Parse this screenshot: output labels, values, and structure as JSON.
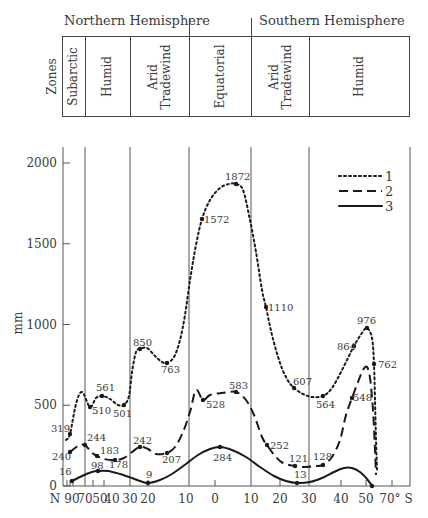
{
  "header": {
    "northern_label": "Northern Hemisphere",
    "southern_label": "Southern Hemisphere",
    "zones_label": "Zones",
    "zones": [
      {
        "name": "Subarctic",
        "lines": [
          "Subarctic"
        ],
        "x0": 62,
        "x1": 85
      },
      {
        "name": "Humid",
        "lines": [
          "Humid"
        ],
        "x0": 85,
        "x1": 130
      },
      {
        "name": "Arid Tradewind",
        "lines": [
          "Arid",
          "Tradewind"
        ],
        "x0": 130,
        "x1": 189
      },
      {
        "name": "Equatorial",
        "lines": [
          "Equatorial"
        ],
        "x0": 189,
        "x1": 251
      },
      {
        "name": "Arid Tradewind",
        "lines": [
          "Arid",
          "Tradewind"
        ],
        "x0": 251,
        "x1": 309
      },
      {
        "name": "Humid",
        "lines": [
          "Humid"
        ],
        "x0": 309,
        "x1": 410
      }
    ]
  },
  "chart_data": {
    "type": "line",
    "title": "",
    "xlabel": "Latitude (N 90° … 70° S)",
    "ylabel": "mm",
    "ylim": [
      0,
      2000
    ],
    "yticks": [
      0,
      500,
      1000,
      1500,
      2000
    ],
    "x_tick_labels": [
      {
        "label": "N 90",
        "px": 67
      },
      {
        "label": "70",
        "px": 75
      },
      {
        "label": "50",
        "px": 93
      },
      {
        "label": "40",
        "px": 104
      },
      {
        "label": "30",
        "px": 130
      },
      {
        "label": "20",
        "px": 148
      },
      {
        "label": "10",
        "px": 186
      },
      {
        "label": "0",
        "px": 215
      },
      {
        "label": "10",
        "px": 251
      },
      {
        "label": "20",
        "px": 280
      },
      {
        "label": "30",
        "px": 309
      },
      {
        "label": "40",
        "px": 341
      },
      {
        "label": "50",
        "px": 366
      },
      {
        "label": "70° S",
        "px": 392
      }
    ],
    "grid": false,
    "zone_boundaries_px": [
      85,
      130,
      189,
      251,
      309,
      410
    ],
    "legend": {
      "position": "upper right",
      "entries": [
        "1",
        "2",
        "3"
      ]
    },
    "series": [
      {
        "name": "1",
        "style": "dotted",
        "labeled_points": [
          {
            "lat": "67N",
            "value": 319,
            "px": 70
          },
          {
            "lat": "55N",
            "value": 510,
            "px": 90
          },
          {
            "lat": "45N",
            "value": 561,
            "px": 102
          },
          {
            "lat": "35N",
            "value": 501,
            "px": 124
          },
          {
            "lat": "25N",
            "value": 850,
            "px": 140
          },
          {
            "lat": "15N",
            "value": 763,
            "px": 167
          },
          {
            "lat": "3N",
            "value": 1572,
            "px": 202
          },
          {
            "lat": "5S",
            "value": 1872,
            "px": 234
          },
          {
            "lat": "15S",
            "value": 1110,
            "px": 265
          },
          {
            "lat": "25S",
            "value": 607,
            "px": 294
          },
          {
            "lat": "35S",
            "value": 564,
            "px": 323
          },
          {
            "lat": "45S",
            "value": 864,
            "px": 354
          },
          {
            "lat": "50S",
            "value": 976,
            "px": 367
          },
          {
            "lat": "55S",
            "value": 762,
            "px": 374
          }
        ],
        "path": [
          [
            66,
            440
          ],
          [
            70,
            434
          ],
          [
            76,
            404
          ],
          [
            82,
            392
          ],
          [
            90,
            407
          ],
          [
            96,
            398
          ],
          [
            102,
            396
          ],
          [
            110,
            399
          ],
          [
            118,
            405
          ],
          [
            124,
            405
          ],
          [
            129,
            396
          ],
          [
            132,
            372
          ],
          [
            136,
            352
          ],
          [
            140,
            349
          ],
          [
            147,
            348
          ],
          [
            155,
            356
          ],
          [
            162,
            362
          ],
          [
            167,
            363
          ],
          [
            174,
            357
          ],
          [
            180,
            340
          ],
          [
            185,
            315
          ],
          [
            190,
            280
          ],
          [
            196,
            245
          ],
          [
            202,
            219
          ],
          [
            210,
            200
          ],
          [
            220,
            188
          ],
          [
            229,
            184
          ],
          [
            236,
            184
          ],
          [
            243,
            190
          ],
          [
            250,
            220
          ],
          [
            256,
            252
          ],
          [
            262,
            290
          ],
          [
            266,
            307
          ],
          [
            272,
            335
          ],
          [
            280,
            363
          ],
          [
            287,
            379
          ],
          [
            294,
            388
          ],
          [
            303,
            394
          ],
          [
            312,
            397
          ],
          [
            323,
            396
          ],
          [
            332,
            388
          ],
          [
            342,
            370
          ],
          [
            354,
            346
          ],
          [
            362,
            333
          ],
          [
            367,
            328
          ],
          [
            372,
            338
          ],
          [
            374,
            364
          ],
          [
            375,
            400
          ],
          [
            376,
            440
          ],
          [
            377,
            470
          ]
        ]
      },
      {
        "name": "2",
        "style": "dashed",
        "labeled_points": [
          {
            "lat": "70N",
            "value": 240,
            "px": 70
          },
          {
            "lat": "63N",
            "value": 244,
            "px": 85
          },
          {
            "lat": "47N",
            "value": 183,
            "px": 97
          },
          {
            "lat": "35N",
            "value": 178,
            "px": 115
          },
          {
            "lat": "23N",
            "value": 242,
            "px": 140
          },
          {
            "lat": "15N",
            "value": 207,
            "px": 167
          },
          {
            "lat": "3N",
            "value": 528,
            "px": 203
          },
          {
            "lat": "7S",
            "value": 583,
            "px": 236
          },
          {
            "lat": "16S",
            "value": 252,
            "px": 267
          },
          {
            "lat": "25S",
            "value": 121,
            "px": 295
          },
          {
            "lat": "35S",
            "value": 128,
            "px": 323
          },
          {
            "lat": "45S",
            "value": 548,
            "px": 352
          }
        ],
        "path": [
          [
            70,
            452
          ],
          [
            78,
            446
          ],
          [
            85,
            445
          ],
          [
            91,
            452
          ],
          [
            97,
            456
          ],
          [
            104,
            459
          ],
          [
            115,
            460
          ],
          [
            124,
            458
          ],
          [
            132,
            452
          ],
          [
            140,
            447
          ],
          [
            148,
            449
          ],
          [
            156,
            454
          ],
          [
            167,
            453
          ],
          [
            175,
            447
          ],
          [
            183,
            432
          ],
          [
            190,
            412
          ],
          [
            196,
            390
          ],
          [
            203,
            400
          ],
          [
            210,
            395
          ],
          [
            222,
            393
          ],
          [
            236,
            392
          ],
          [
            246,
            400
          ],
          [
            254,
            415
          ],
          [
            262,
            437
          ],
          [
            267,
            445
          ],
          [
            275,
            456
          ],
          [
            283,
            463
          ],
          [
            295,
            466
          ],
          [
            305,
            467
          ],
          [
            315,
            466
          ],
          [
            323,
            465
          ],
          [
            332,
            457
          ],
          [
            340,
            440
          ],
          [
            346,
            415
          ],
          [
            352,
            398
          ],
          [
            358,
            382
          ],
          [
            363,
            370
          ],
          [
            367,
            367
          ],
          [
            370,
            378
          ],
          [
            373,
            410
          ],
          [
            375,
            450
          ],
          [
            376,
            475
          ]
        ]
      },
      {
        "name": "3",
        "style": "solid",
        "labeled_points": [
          {
            "lat": "70N",
            "value": 16,
            "px": 72
          },
          {
            "lat": "45N",
            "value": 98,
            "px": 97
          },
          {
            "lat": "20N",
            "value": 9,
            "px": 148
          },
          {
            "lat": "2S",
            "value": 284,
            "px": 220
          },
          {
            "lat": "26S",
            "value": 13,
            "px": 297
          },
          {
            "lat": "53S",
            "value": 0,
            "px": 374
          }
        ],
        "path": [
          [
            72,
            481
          ],
          [
            82,
            476
          ],
          [
            92,
            472
          ],
          [
            98,
            471
          ],
          [
            108,
            471
          ],
          [
            120,
            474
          ],
          [
            132,
            478
          ],
          [
            140,
            481
          ],
          [
            148,
            483
          ],
          [
            160,
            480
          ],
          [
            172,
            474
          ],
          [
            186,
            464
          ],
          [
            198,
            455
          ],
          [
            210,
            449
          ],
          [
            220,
            447
          ],
          [
            232,
            450
          ],
          [
            246,
            457
          ],
          [
            260,
            467
          ],
          [
            274,
            476
          ],
          [
            286,
            481
          ],
          [
            297,
            483
          ],
          [
            310,
            482
          ],
          [
            322,
            478
          ],
          [
            334,
            472
          ],
          [
            344,
            468
          ],
          [
            352,
            468
          ],
          [
            360,
            472
          ],
          [
            367,
            479
          ],
          [
            372,
            486
          ]
        ]
      }
    ]
  },
  "annotations": [
    {
      "text": "319",
      "x": 51,
      "y": 432
    },
    {
      "text": "510",
      "x": 92,
      "y": 414
    },
    {
      "text": "561",
      "x": 96,
      "y": 391
    },
    {
      "text": "501",
      "x": 113,
      "y": 417
    },
    {
      "text": "850",
      "x": 133,
      "y": 346
    },
    {
      "text": "763",
      "x": 161,
      "y": 373
    },
    {
      "text": "1572",
      "x": 204,
      "y": 223
    },
    {
      "text": "1872",
      "x": 225,
      "y": 180
    },
    {
      "text": "1110",
      "x": 268,
      "y": 311
    },
    {
      "text": "607",
      "x": 293,
      "y": 385
    },
    {
      "text": "564",
      "x": 316,
      "y": 408
    },
    {
      "text": "864",
      "x": 337,
      "y": 350
    },
    {
      "text": "976",
      "x": 357,
      "y": 324
    },
    {
      "text": "762",
      "x": 378,
      "y": 368
    },
    {
      "text": "244",
      "x": 87,
      "y": 441
    },
    {
      "text": "240",
      "x": 52,
      "y": 460
    },
    {
      "text": "183",
      "x": 100,
      "y": 454
    },
    {
      "text": "178",
      "x": 109,
      "y": 468
    },
    {
      "text": "242",
      "x": 133,
      "y": 444
    },
    {
      "text": "207",
      "x": 162,
      "y": 463
    },
    {
      "text": "528",
      "x": 206,
      "y": 408
    },
    {
      "text": "583",
      "x": 229,
      "y": 389
    },
    {
      "text": "252",
      "x": 270,
      "y": 449
    },
    {
      "text": "121",
      "x": 289,
      "y": 462
    },
    {
      "text": "128",
      "x": 313,
      "y": 460
    },
    {
      "text": "548",
      "x": 353,
      "y": 401
    },
    {
      "text": "16",
      "x": 59,
      "y": 475
    },
    {
      "text": "98",
      "x": 91,
      "y": 469
    },
    {
      "text": "9",
      "x": 146,
      "y": 478
    },
    {
      "text": "284",
      "x": 213,
      "y": 461
    },
    {
      "text": "13",
      "x": 294,
      "y": 478
    }
  ]
}
